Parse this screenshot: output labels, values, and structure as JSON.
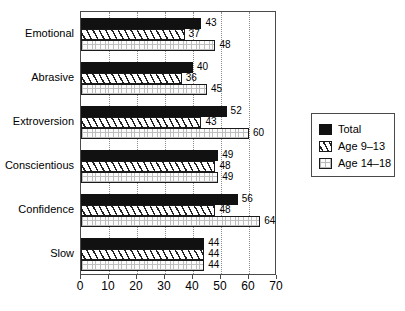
{
  "chart_data": {
    "type": "bar",
    "orientation": "horizontal",
    "title": "",
    "xlabel": "",
    "ylabel": "",
    "xlim": [
      0,
      70
    ],
    "xticks": [
      0,
      10,
      20,
      30,
      40,
      50,
      60,
      70
    ],
    "xtick_labels": [
      "0",
      "10",
      "20",
      "30",
      "40",
      "50",
      "60",
      "70"
    ],
    "grid": "vertical-dotted",
    "gridlines": [
      10,
      20,
      30,
      40,
      50,
      60
    ],
    "legend_position": "right-outside",
    "categories": [
      "Emotional",
      "Abrasive",
      "Extroversion",
      "Conscientious",
      "Confidence",
      "Slow"
    ],
    "series": [
      {
        "name": "Total",
        "fill": "solid-black",
        "color": "#111111",
        "values": [
          43,
          40,
          52,
          49,
          56,
          44
        ]
      },
      {
        "name": "Age 9–13",
        "fill": "diagonal-hatch",
        "color": "#ffffff",
        "values": [
          37,
          36,
          43,
          48,
          48,
          44
        ]
      },
      {
        "name": "Age 14–18",
        "fill": "dotted-light",
        "color": "#fbfbfb",
        "values": [
          48,
          45,
          60,
          49,
          64,
          44
        ]
      }
    ]
  },
  "legend": {
    "items": [
      {
        "label": "Total",
        "swatch": "total"
      },
      {
        "label": "Age 9–13",
        "swatch": "age913"
      },
      {
        "label": "Age 14–18",
        "swatch": "age1418"
      }
    ]
  }
}
